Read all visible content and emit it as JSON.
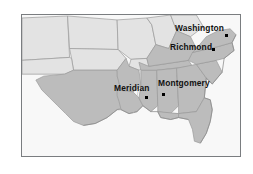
{
  "figure": {
    "kind": "map",
    "title": "",
    "frame_border_color": "#7a7d80",
    "background_color": "#fafafa"
  },
  "map": {
    "region": "Southeastern United States",
    "projection_note": "",
    "colors": {
      "ocean": "#f8f8f8",
      "highlighted_states": "#b8b8b8",
      "other_states": "#e0e0e0",
      "state_border": "#9a9a9a",
      "coastline": "#8e8e8e",
      "marker": "#000000",
      "label": "#111111"
    },
    "legend": [],
    "cities": [
      {
        "name": "Washington",
        "marker": "city-dot",
        "label_position": "left-of-dot"
      },
      {
        "name": "Richmond",
        "marker": "city-dot",
        "label_position": "left-of-dot"
      },
      {
        "name": "Meridian",
        "marker": "city-dot",
        "label_position": "above-dot"
      },
      {
        "name": "Montgomery",
        "marker": "city-dot",
        "label_position": "above-dot"
      }
    ]
  }
}
